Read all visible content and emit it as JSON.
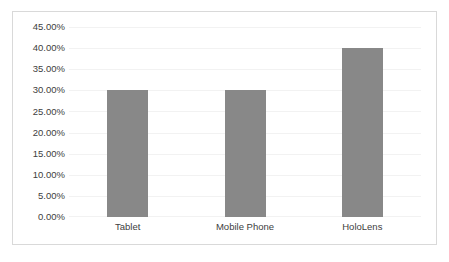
{
  "chart_data": {
    "type": "bar",
    "title": "",
    "subtitle": "",
    "xlabel": "",
    "ylabel": "",
    "categories": [
      "Tablet",
      "Mobile Phone",
      "HoloLens"
    ],
    "values": [
      30.0,
      30.0,
      40.0
    ],
    "value_labels": [
      "30.00%",
      "30.00%",
      "40.00%"
    ],
    "series": [
      {
        "name": "",
        "values": [
          30.0,
          30.0,
          40.0
        ]
      }
    ],
    "ylim": [
      0,
      45
    ],
    "y_tick_values": [
      45,
      40,
      35,
      30,
      25,
      20,
      15,
      10,
      5,
      0
    ],
    "y_tick_labels": [
      "45.00%",
      "40.00%",
      "35.00%",
      "30.00%",
      "25.00%",
      "20.00%",
      "15.00%",
      "10.00%",
      "5.00%",
      "0.00%"
    ],
    "grid": true,
    "grid_axis": "y",
    "legend": false,
    "legend_position": "none",
    "annotations": [],
    "colors": {
      "bar_fill": "#888888",
      "gridline": "#f2f2f2",
      "border": "#d9d9d9",
      "tick_label": "#404040",
      "background": "#ffffff"
    }
  }
}
